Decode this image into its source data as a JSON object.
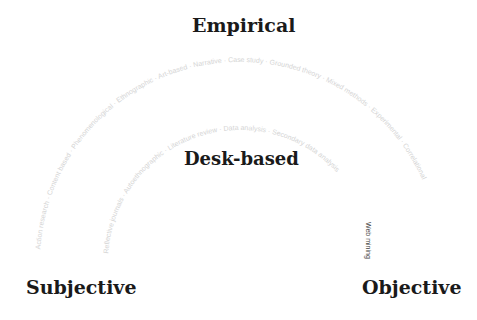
{
  "titles": {
    "top": "Empirical",
    "center": "Desk-based",
    "left": "Subjective",
    "right": "Objective"
  },
  "outer_arc": {
    "labels": [
      "Action research",
      "Content based",
      "Phenomenological",
      "Ethnographic",
      "Art-based",
      "Narrative",
      "Case study",
      "Grounded theory",
      "Mixed methods",
      "Experimental",
      "Correlational"
    ]
  },
  "inner_arc": {
    "labels": [
      "Reflective journals",
      "Autoethnographic",
      "Literature review",
      "Data analysis",
      "Secondary data analysis"
    ]
  },
  "highlight": {
    "label": "Web mining"
  },
  "colors": {
    "title": "#1a1a1a",
    "arc_text": "#d4d4d4",
    "highlight_text": "#444444"
  }
}
